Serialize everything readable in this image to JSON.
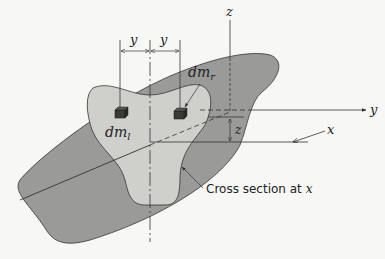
{
  "figure": {
    "colors": {
      "background": "#f7f7f5",
      "outer_body": "#9a9a98",
      "cross_section": "#cfcfcc",
      "line": "#333333",
      "mass_element": "#3a3a38"
    },
    "labels": {
      "y_dim_left": "y",
      "y_dim_right": "y",
      "dm_left_base": "dm",
      "dm_left_sub": "l",
      "dm_right_base": "dm",
      "dm_right_sub": "r",
      "z_axis": "z",
      "y_axis": "y",
      "x_axis_left": "x",
      "x_dim_right": "x",
      "z_dim": "z",
      "cross_section_caption": "Cross section at ",
      "cross_section_var": "x"
    }
  }
}
